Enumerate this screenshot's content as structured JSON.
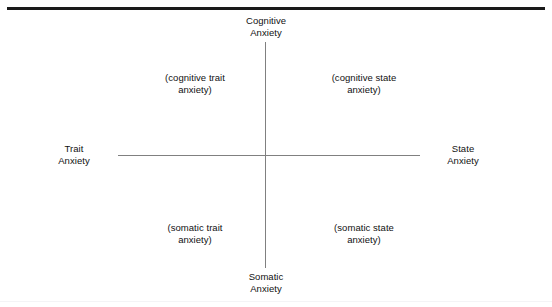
{
  "figure": {
    "background_color": "#ffffff",
    "rule_color": "#1a1a1a",
    "axis_color": "#808080",
    "text_color": "#111111"
  },
  "axes": {
    "top_label": "Cognitive\nAnxiety",
    "bottom_label": "Somatic\nAnxiety",
    "left_label": "Trait\nAnxiety",
    "right_label": "State\nAnxiety"
  },
  "quadrants": {
    "top_left": "(cognitive trait\nanxiety)",
    "top_right": "(cognitive state\nanxiety)",
    "bottom_left": "(somatic trait\nanxiety)",
    "bottom_right": "(somatic state\nanxiety)"
  },
  "chart_data": {
    "type": "scatter",
    "title": "",
    "xlabel": "Trait Anxiety — State Anxiety",
    "ylabel": "Somatic Anxiety — Cognitive Anxiety",
    "x_axis_ends": [
      "Trait Anxiety",
      "State Anxiety"
    ],
    "y_axis_ends": [
      "Somatic Anxiety",
      "Cognitive Anxiety"
    ],
    "grid": false,
    "legend": "none",
    "quadrant_labels": [
      "(cognitive trait anxiety)",
      "(cognitive state anxiety)",
      "(somatic trait anxiety)",
      "(somatic state anxiety)"
    ],
    "series": [],
    "values": []
  }
}
